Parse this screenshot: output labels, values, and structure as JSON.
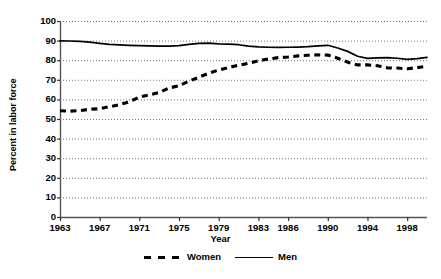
{
  "chart_data": {
    "type": "line",
    "title": "",
    "xlabel": "Year",
    "ylabel": "Percent in labor force",
    "xlim": [
      1963,
      2000
    ],
    "ylim": [
      0,
      100
    ],
    "ytick_labels": [
      "100",
      "90",
      "80",
      "70",
      "60",
      "50",
      "40",
      "30",
      "20",
      "10",
      "0"
    ],
    "ytick_values": [
      100,
      90,
      80,
      70,
      60,
      50,
      40,
      30,
      20,
      10,
      0
    ],
    "xtick_labels": [
      "1963",
      "1967",
      "1971",
      "1975",
      "1979",
      "1983",
      "1986",
      "1990",
      "1994",
      "1998"
    ],
    "xtick_values": [
      1963,
      1967,
      1971,
      1975,
      1979,
      1983,
      1986,
      1990,
      1994,
      1998
    ],
    "grid": true,
    "grid_style": "dotted-horizontal",
    "legend_position": "bottom",
    "x": [
      1963,
      1964,
      1965,
      1966,
      1967,
      1968,
      1969,
      1970,
      1971,
      1972,
      1973,
      1974,
      1975,
      1976,
      1977,
      1978,
      1979,
      1980,
      1981,
      1982,
      1983,
      1984,
      1985,
      1986,
      1987,
      1988,
      1989,
      1990,
      1991,
      1992,
      1993,
      1994,
      1995,
      1996,
      1997,
      1998,
      1999,
      2000
    ],
    "series": [
      {
        "name": "Women",
        "style": "dashed",
        "color": "#000000",
        "values": [
          54.2,
          54.0,
          54.3,
          55.0,
          55.2,
          56.3,
          57.3,
          58.8,
          61.2,
          62.3,
          63.5,
          65.8,
          67.0,
          69.3,
          71.3,
          73.4,
          75.0,
          76.3,
          77.4,
          78.4,
          79.7,
          80.6,
          81.3,
          81.6,
          82.2,
          82.5,
          82.7,
          82.6,
          81.0,
          79.0,
          77.6,
          77.6,
          77.2,
          76.1,
          76.0,
          75.6,
          76.2,
          76.9
        ]
      },
      {
        "name": "Men",
        "style": "solid",
        "color": "#000000",
        "values": [
          89.9,
          89.8,
          89.6,
          89.2,
          88.6,
          88.1,
          87.8,
          87.6,
          87.4,
          87.3,
          87.2,
          87.2,
          87.4,
          88.1,
          88.6,
          88.7,
          88.3,
          88.2,
          87.9,
          87.2,
          86.8,
          86.6,
          86.5,
          86.6,
          86.7,
          86.9,
          87.3,
          87.6,
          86.2,
          84.5,
          82.0,
          80.9,
          81.2,
          81.3,
          81.0,
          80.4,
          80.8,
          81.4
        ]
      }
    ]
  },
  "axis_geometry": {
    "plot_left": 60,
    "plot_right": 427,
    "plot_top": 21,
    "plot_bottom": 217
  }
}
